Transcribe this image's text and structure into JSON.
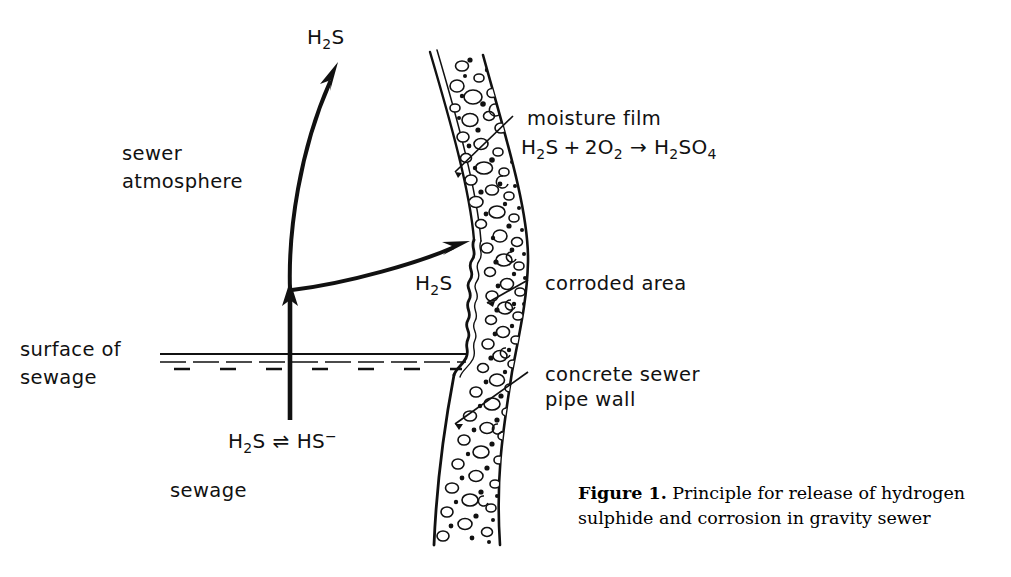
{
  "figure": {
    "domain_kind": "technical-diagram",
    "caption_label": "Figure 1.",
    "caption_line1": " Principle for release of hydrogen",
    "caption_line2": "sulphide and corrosion in gravity sewer"
  },
  "labels": {
    "top_gas": {
      "formula": "H",
      "sub1": "2",
      "tail": "S"
    },
    "sewer_atmosphere_line1": "sewer",
    "sewer_atmosphere_line2": "atmosphere",
    "surface_line1": "surface of",
    "surface_line2": "sewage",
    "sewage": "sewage",
    "transfer_gas": {
      "formula": "H",
      "sub1": "2",
      "tail": "S"
    },
    "moisture_film_title": "moisture  film",
    "corroded_area": "corroded  area",
    "pipe_wall_line1": "concrete  sewer",
    "pipe_wall_line2": "pipe wall"
  },
  "equations": {
    "oxidation": {
      "full": "H2S + 2O2 → H2SO4",
      "r1_sym": "H",
      "r1_sub": "2",
      "r1_tail": "S",
      "plus": "+",
      "r2_coeff": "2",
      "r2_sym": "O",
      "r2_sub": "2",
      "arrow": "→",
      "p_sym": "H",
      "p_sub1": "2",
      "p_mid": "SO",
      "p_sub2": "4"
    },
    "dissociation": {
      "full": "H2S ⇌ HS−",
      "l_sym": "H",
      "l_sub": "2",
      "l_tail": "S",
      "equil_arrow": "⇌",
      "r_sym": "HS",
      "r_charge": "−"
    }
  },
  "colors": {
    "ink": "#111111",
    "paper": "#ffffff",
    "caption": "#000000"
  }
}
